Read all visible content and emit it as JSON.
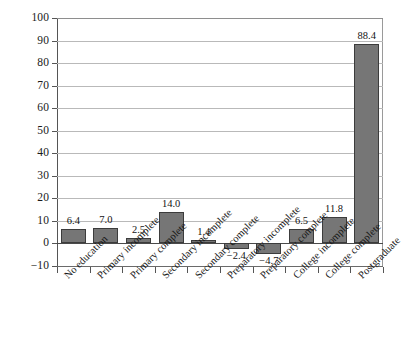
{
  "chart_data": {
    "type": "bar",
    "title": "",
    "subtitle": "",
    "xlabel": "",
    "ylabel": "",
    "categories": [
      "No education",
      "Primary incomplete",
      "Primary complete",
      "Secondary incomplete",
      "Secondary complete",
      "Preparatory incomplete",
      "Preparatory complete",
      "College incomplete",
      "College complete",
      "Postgraduate"
    ],
    "values": [
      6.4,
      7.0,
      2.5,
      14.0,
      1.4,
      -2.4,
      -4.7,
      6.5,
      11.8,
      88.4
    ],
    "value_labels": [
      "6.4",
      "7.0",
      "2.5",
      "14.0",
      "1.4",
      "−2.4",
      "−4.7",
      "6.5",
      "11.8",
      "88.4"
    ],
    "ylim": [
      -10,
      100
    ],
    "ytick_values": [
      100,
      90,
      80,
      70,
      60,
      50,
      40,
      30,
      20,
      10,
      0,
      -10
    ],
    "ytick_labels": [
      "100",
      "90",
      "80",
      "70",
      "60",
      "50",
      "40",
      "30",
      "20",
      "10",
      "0",
      "−10"
    ],
    "grid": true,
    "legend": false,
    "legend_position": "none",
    "bar_color": "#767676",
    "bar_border_color": "#3c3c3c",
    "gridline_color": "#b9b9b9",
    "axis_color": "#555555",
    "background_color": "#ffffff",
    "x_label_rotation": -45
  }
}
